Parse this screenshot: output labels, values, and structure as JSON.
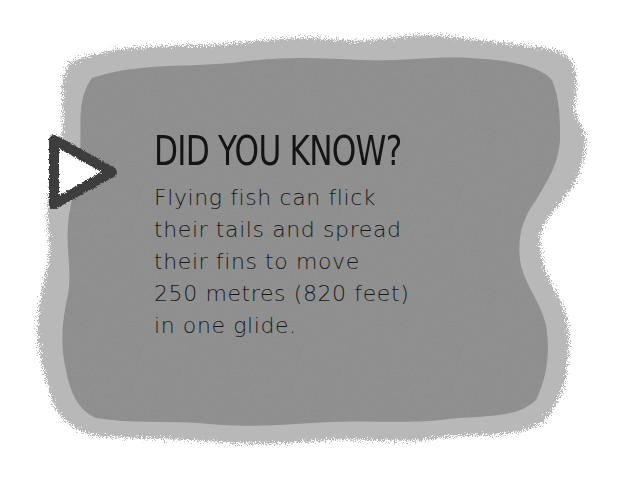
{
  "card": {
    "heading": "DID YOU KNOW?",
    "body_lines": [
      "Flying fish can flick",
      "their tails and spread",
      "their fins to move",
      "250 metres (820 feet)",
      "in one glide."
    ],
    "body": "Flying fish can flick\ntheir tails and spread\ntheir fins to move\n250 metres (820 feet)\nin one glide.",
    "icon": "play-triangle-icon"
  },
  "colors": {
    "background": "#ffffff",
    "panel_fill": "#8a8a8a",
    "panel_edge": "#b4b4b4",
    "text": "#141414",
    "icon_stroke": "#3c3c3c",
    "icon_fill": "#ffffff"
  }
}
